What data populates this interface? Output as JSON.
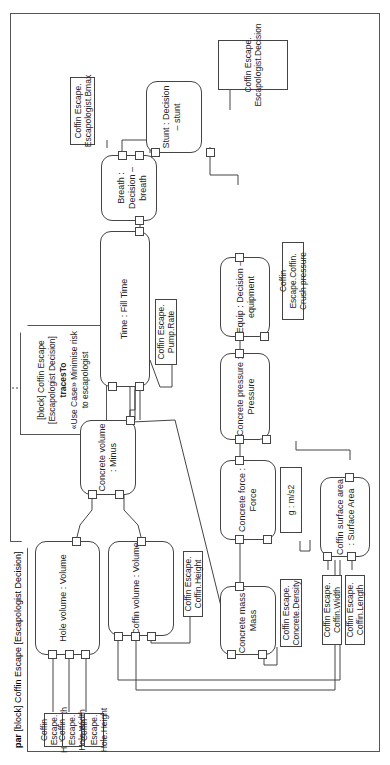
{
  "frame": {
    "kind": "par",
    "title": "[block] Coffin Escape [Escapologist Decision]"
  },
  "note": {
    "header": "[block] Coffin Escape [Escapologist Decision]",
    "keyword": "tracesTo",
    "body": "«Use Case» Minimise risk to escapologist"
  },
  "constraints": {
    "hole_volume": {
      "title": "Hole volume : Volume",
      "ports": {
        "l": "l",
        "w": "w",
        "h": "h",
        "v": "v"
      }
    },
    "coffin_volume": {
      "title": "Coffin volume : Volume",
      "ports": {
        "l": "l",
        "w": "w",
        "h": "h",
        "v": "v"
      }
    },
    "concrete_volume": {
      "title": "Concrete volume : Minus",
      "ports": {
        "a": "a",
        "b": "b",
        "r": "r"
      }
    },
    "time": {
      "title": "Time : Fill Time",
      "ports": {
        "v": "v",
        "r": "r",
        "t": "t"
      }
    },
    "breath": {
      "title": "Breath : Decision – breath",
      "ports": {
        "breath_time": "breath time",
        "fill_time": "fill time",
        "result": "result"
      }
    },
    "stunt": {
      "title": "Stunt : Decision – stunt",
      "ports": {
        "breath_result": "breath result",
        "equipment_result": "equipment result",
        "result": "result"
      }
    },
    "concrete_mass": {
      "title": "Concrete mass : Mass",
      "ports": {
        "v": "v",
        "d": "d",
        "m": "m"
      }
    },
    "concrete_force": {
      "title": "Concrete force : Force",
      "ports": {
        "m": "m",
        "a": "a",
        "f": "f"
      }
    },
    "concrete_pressure": {
      "title": "Concrete pressure : Pressure",
      "ports": {
        "f": "f",
        "a": "a",
        "p": "p"
      }
    },
    "equip": {
      "title": "Equip : Decision – equipment",
      "ports": {
        "pressure": "pressure",
        "strength": "strength",
        "result": "result"
      }
    },
    "coffin_surface": {
      "title": "Coffin surface area : Surface Area",
      "ports": {
        "w": "w",
        "l": "l",
        "sa": "sa"
      }
    }
  },
  "properties": {
    "hole_length": "Coffin Escape. Hole.Length",
    "hole_width": "Coffin Escape. Hole.Width",
    "hole_height": "Coffin Escape. Hole.Height",
    "coffin_height": "Coffin Escape. Coffin.Height",
    "pump_rate": "Coffin Escape. Pump.Rate",
    "bmax": "Coffin Escape. Escapologist.Bmax",
    "decision": "Coffin Escape. Escapologist.Decision",
    "concrete_density": "Coffin Escape. Concrete.Density",
    "g": "g : m/s2",
    "crush_pressure": "Coffin Escape.Coffin. Crush pressure",
    "coffin_width": "Coffin Escape. Coffin.Width",
    "coffin_length": "Coffin Escape. Coffin.Length"
  }
}
